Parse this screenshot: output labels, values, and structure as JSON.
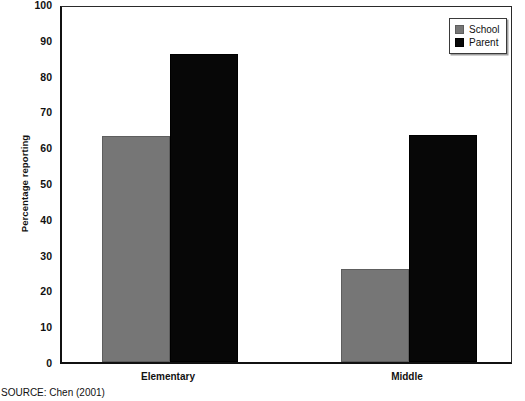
{
  "chart_data": {
    "type": "bar",
    "title": "",
    "xlabel": "",
    "ylabel": "Percentage reporting",
    "categories": [
      "Elementary",
      "Middle"
    ],
    "series": [
      {
        "name": "School",
        "color": "#767676",
        "values": [
          63,
          26
        ]
      },
      {
        "name": "Parent",
        "color": "#070707",
        "values": [
          86,
          63.5
        ]
      }
    ],
    "ylim": [
      0,
      100
    ],
    "ytick_values": [
      0,
      10,
      20,
      30,
      40,
      50,
      60,
      70,
      80,
      90,
      100
    ],
    "ytick_labels": [
      "0",
      "10",
      "20",
      "30",
      "40",
      "50",
      "60",
      "70",
      "80",
      "90",
      "100"
    ],
    "grid": false,
    "legend_position": "top-right",
    "legend_entries": [
      "School",
      "Parent"
    ]
  },
  "figure": {
    "source_note": "SOURCE: Chen (2001)"
  }
}
